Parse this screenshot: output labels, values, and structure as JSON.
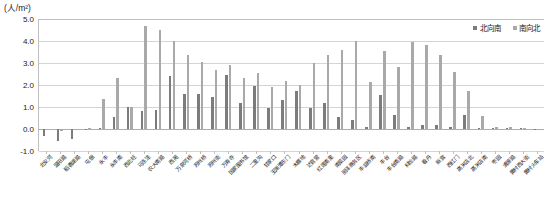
{
  "chart_data": {
    "type": "bar",
    "title": "",
    "subtitle": "",
    "unit_label": "(人/m²)",
    "xlabel": "",
    "ylabel": "",
    "ylim": [
      -1.0,
      5.0
    ],
    "yticks": [
      "-1.0",
      "0.0",
      "1.0",
      "2.0",
      "3.0",
      "4.0",
      "5.0"
    ],
    "ytick_values": [
      -1.0,
      0.0,
      1.0,
      2.0,
      3.0,
      4.0,
      5.0
    ],
    "grid": true,
    "legend_position": "top-right",
    "categories": [
      "北安河",
      "温阳路",
      "稻香湖路",
      "屯佃",
      "永丰",
      "永丰南",
      "西北旺",
      "马连洼",
      "农大南路",
      "西苑",
      "万泉河桥",
      "苏州桥",
      "苏州街",
      "万寿寺",
      "国家图书馆",
      "二里沟",
      "甘家口",
      "玉渊潭东门",
      "木樨地",
      "达官营",
      "红莲南里",
      "南菜园",
      "丽泽商务区",
      "丰益桥南",
      "丰台",
      "丰台南路",
      "科怡路",
      "看丹",
      "新宫",
      "西红门",
      "高米店北",
      "高米店南",
      "枣园",
      "清源路",
      "黄村西大街",
      "黄村火车站"
    ],
    "series": [
      {
        "name": "北向南",
        "color": "#7c7c7c",
        "values": [
          -0.3,
          -0.55,
          -0.45,
          -0.05,
          0.05,
          0.55,
          1.0,
          0.8,
          0.85,
          2.4,
          1.6,
          1.6,
          1.45,
          2.45,
          1.2,
          1.95,
          0.95,
          1.3,
          1.75,
          0.95,
          1.2,
          0.55,
          0.4,
          0.1,
          1.55,
          0.65,
          0.1,
          0.2,
          0.2,
          0.1,
          0.65,
          0.05,
          0.04,
          0.03,
          0.03,
          0.02
        ]
      },
      {
        "name": "南向北",
        "color": "#a9a9a9",
        "values": [
          -0.05,
          -0.1,
          -0.05,
          0.05,
          1.35,
          2.3,
          1.0,
          4.7,
          4.5,
          4.0,
          3.35,
          3.05,
          2.7,
          2.9,
          2.3,
          2.55,
          1.9,
          2.2,
          2.0,
          3.0,
          3.35,
          3.6,
          4.0,
          2.15,
          3.55,
          2.8,
          3.95,
          3.8,
          3.35,
          2.6,
          1.75,
          0.6,
          0.1,
          0.1,
          0.05,
          0.02
        ]
      }
    ]
  },
  "legend": {
    "items": [
      {
        "label": "北向南"
      },
      {
        "label": "南向北"
      }
    ]
  }
}
